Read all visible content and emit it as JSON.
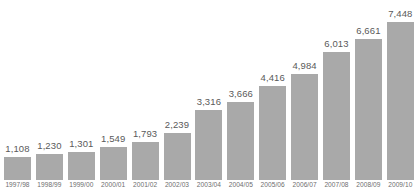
{
  "chart_data": {
    "type": "bar",
    "title": "",
    "xlabel": "",
    "ylabel": "",
    "categories": [
      "1997/98",
      "1998/99",
      "1999/00",
      "2000/01",
      "2001/02",
      "2002/03",
      "2003/04",
      "2004/05",
      "2005/06",
      "2006/07",
      "2007/08",
      "2008/09",
      "2009/10"
    ],
    "values": [
      1108,
      1230,
      1301,
      1549,
      1793,
      2239,
      3316,
      3666,
      4416,
      4984,
      6013,
      6661,
      7448
    ],
    "value_labels": [
      "1,108",
      "1,230",
      "1,301",
      "1,549",
      "1,793",
      "2,239",
      "3,316",
      "3,666",
      "4,416",
      "4,984",
      "6,013",
      "6,661",
      "7,448"
    ],
    "ylim": [
      0,
      7448
    ],
    "grid": false,
    "legend": null,
    "legend_position": "none",
    "bar_color": "#a9a9a9",
    "value_label_color": "#5a5a5a",
    "axis_label_color": "#6e6e6e",
    "background_color": "#ffffff"
  }
}
